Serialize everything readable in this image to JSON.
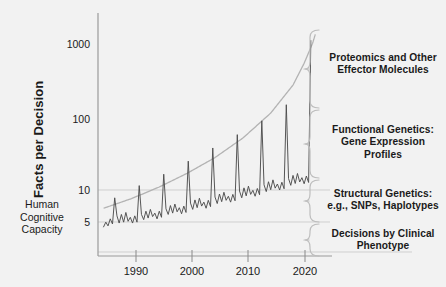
{
  "chart_data": {
    "type": "line",
    "title": "",
    "xlabel": "",
    "ylabel": "Facts per Decision",
    "yscale": "log",
    "ylim": [
      2.2,
      3000
    ],
    "xlim": [
      1982,
      2024
    ],
    "grid": "horizontal-light",
    "yticks": [
      {
        "value": 1000,
        "label": "1000"
      },
      {
        "value": 100,
        "label": "100"
      },
      {
        "value": 10,
        "label": "10"
      },
      {
        "value": 5,
        "label": "5"
      }
    ],
    "xticks": [
      {
        "value": 1990,
        "label": "1990"
      },
      {
        "value": 2000,
        "label": "2000"
      },
      {
        "value": 2010,
        "label": "2010"
      },
      {
        "value": 2020,
        "label": "2020"
      }
    ],
    "series": [
      {
        "name": "Facts per Decision",
        "color": "#4d4d4d",
        "note": "noisy sawtooth with periodic spikes rising exponentially",
        "x": [
          1983.0,
          1983.4,
          1983.8,
          1984.2,
          1984.6,
          1985.0,
          1985.4,
          1985.8,
          1986.2,
          1986.6,
          1987.0,
          1987.4,
          1987.8,
          1988.2,
          1988.6,
          1989.0,
          1989.4,
          1989.8,
          1990.2,
          1990.6,
          1991.0,
          1991.4,
          1991.8,
          1992.2,
          1992.6,
          1993.0,
          1993.4,
          1993.8,
          1994.2,
          1994.6,
          1995.0,
          1995.4,
          1995.8,
          1996.2,
          1996.6,
          1997.0,
          1997.4,
          1997.8,
          1998.2,
          1998.6,
          1999.0,
          1999.4,
          1999.8,
          2000.2,
          2000.6,
          2001.0,
          2001.4,
          2001.8,
          2002.2,
          2002.6,
          2003.0,
          2003.4,
          2003.8,
          2004.2,
          2004.6,
          2005.0,
          2005.4,
          2005.8,
          2006.2,
          2006.6,
          2007.0,
          2007.4,
          2007.8,
          2008.2,
          2008.6,
          2009.0,
          2009.4,
          2009.8,
          2010.2,
          2010.6,
          2011.0,
          2011.4,
          2011.8,
          2012.2,
          2012.6,
          2013.0,
          2013.4,
          2013.8,
          2014.2,
          2014.6,
          2015.0,
          2015.4,
          2015.8,
          2016.2,
          2016.6,
          2017.0,
          2017.4,
          2017.8,
          2018.2,
          2018.6,
          2019.0,
          2019.4,
          2019.8,
          2020.2
        ],
        "y": [
          3.1,
          3.6,
          3.2,
          4.0,
          3.4,
          7.8,
          4.4,
          3.5,
          4.6,
          3.6,
          4.9,
          3.7,
          4.2,
          3.5,
          4.4,
          3.6,
          11.5,
          4.6,
          3.9,
          5.1,
          4.1,
          5.4,
          4.3,
          4.8,
          4.0,
          5.1,
          4.2,
          16.5,
          5.5,
          4.6,
          6.1,
          4.8,
          6.4,
          5.0,
          5.7,
          4.7,
          6.0,
          4.9,
          25.0,
          6.6,
          5.4,
          7.3,
          5.7,
          7.7,
          6.0,
          6.8,
          5.6,
          7.2,
          5.9,
          38.0,
          8.0,
          6.5,
          8.8,
          6.9,
          9.3,
          7.2,
          8.2,
          6.8,
          8.7,
          7.1,
          58.0,
          9.7,
          7.8,
          10.7,
          8.3,
          11.3,
          8.7,
          9.9,
          8.2,
          10.5,
          8.6,
          90.0,
          11.8,
          9.5,
          13.0,
          10.1,
          13.8,
          10.6,
          12.1,
          10.0,
          12.8,
          10.4,
          150.0,
          14.4,
          11.6,
          15.9,
          12.3,
          16.9,
          12.9,
          14.8,
          12.2,
          15.6,
          12.7,
          1150.0
        ]
      },
      {
        "name": "envelope",
        "color": "#b3b3b3",
        "note": "smooth exponential upper bound from ~5.5 in 1983 to ~1300 in 2021",
        "x": [
          1983,
          1988,
          1993,
          1998,
          2003,
          2008,
          2013,
          2017,
          2019,
          2020.5,
          2021
        ],
        "y": [
          5.6,
          7.6,
          11.0,
          17.0,
          28.0,
          52.0,
          115.0,
          280.0,
          560.0,
          1050.0,
          1400.0
        ]
      }
    ]
  },
  "axes": {
    "ylabel": "Facts per Decision",
    "ytick_1000": "1000",
    "ytick_100": "100",
    "ytick_10": "10",
    "ytick_5": "5",
    "xtick_1990": "1990",
    "xtick_2000": "2000",
    "xtick_2010": "2010",
    "xtick_2020": "2020"
  },
  "left_annotation": {
    "line1": "Human",
    "line2": "Cognitive",
    "line3": "Capacity"
  },
  "right_annotations": [
    {
      "id": "proteomics",
      "text": "Proteomics and Other\nEffector Molecules"
    },
    {
      "id": "functional-genetics",
      "text": "Functional Genetics:\nGene Expression\nProfiles"
    },
    {
      "id": "structural-genetics",
      "text": "Structural Genetics:\ne.g., SNPs, Haplotypes"
    },
    {
      "id": "clinical-phenotype",
      "text": "Decisions by Clinical\nPhenotype"
    }
  ],
  "colors": {
    "background": "#f2f2f2",
    "data_line": "#4d4d4d",
    "envelope_line": "#b3b3b3",
    "axis": "#999999",
    "grid": "#cccccc",
    "text": "#1a1a1a",
    "brace": "#b3b3b3"
  }
}
